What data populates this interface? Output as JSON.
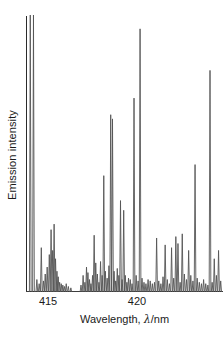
{
  "axes": {
    "ylabel": "Emission intensity",
    "xlabel_prefix": "Wavelength, ",
    "xlabel_symbol": "λ",
    "xlabel_suffix": "/nm",
    "xlabel_full": "Wavelength, λ/nm",
    "xticks": [
      {
        "label": "415",
        "value": 415
      },
      {
        "label": "420",
        "value": 420
      }
    ],
    "line_color": "#2b2b2b"
  },
  "chart_data": {
    "type": "line",
    "subtype": "emission-spectrum-stick",
    "title": "",
    "xlabel": "Wavelength, λ/nm",
    "ylabel": "Emission intensity",
    "xlim": [
      413.76,
      424.83
    ],
    "ylim": [
      0,
      1
    ],
    "xticks": [
      415,
      420
    ],
    "yticks": [],
    "grid": false,
    "legend": null,
    "trace_color": "#555555",
    "note": "Atomic emission line spectrum; y values are relative emission intensity normalized to the tallest lines (=1.0). x values in nm.",
    "series": [
      {
        "name": "Emission intensity",
        "x": [
          414.0,
          414.18,
          414.37,
          414.5,
          414.62,
          414.74,
          414.84,
          414.95,
          415.07,
          415.17,
          415.26,
          415.34,
          415.42,
          415.5,
          415.57,
          415.65,
          415.74,
          415.83,
          415.92,
          416.02,
          416.14,
          416.28,
          416.85,
          416.97,
          417.07,
          417.16,
          417.24,
          417.33,
          417.41,
          417.5,
          417.59,
          417.68,
          417.77,
          417.86,
          417.95,
          418.04,
          418.13,
          418.22,
          418.32,
          418.42,
          418.52,
          418.62,
          418.71,
          418.8,
          418.89,
          418.98,
          419.07,
          419.16,
          419.25,
          419.34,
          419.43,
          419.52,
          419.62,
          419.72,
          419.83,
          419.95,
          420.06,
          420.17,
          420.28,
          420.39,
          420.5,
          420.62,
          420.74,
          420.86,
          420.98,
          421.1,
          421.22,
          421.34,
          421.46,
          421.58,
          421.7,
          421.82,
          421.94,
          422.06,
          422.18,
          422.3,
          422.42,
          422.54,
          422.66,
          422.78,
          422.9,
          423.02,
          423.14,
          423.26,
          423.38,
          423.5,
          423.62,
          423.74,
          423.86,
          423.98,
          424.1,
          424.22,
          424.34,
          424.46,
          424.58,
          424.7
        ],
        "y": [
          1.0,
          1.0,
          0.045,
          0.03,
          0.16,
          0.04,
          0.065,
          0.09,
          0.135,
          0.225,
          0.15,
          0.245,
          0.12,
          0.075,
          0.055,
          0.035,
          0.03,
          0.025,
          0.02,
          0.03,
          0.02,
          0.015,
          0.025,
          0.06,
          0.035,
          0.09,
          0.07,
          0.045,
          0.03,
          0.06,
          0.205,
          0.105,
          0.065,
          0.035,
          0.11,
          0.06,
          0.42,
          0.075,
          0.05,
          0.095,
          0.64,
          0.625,
          0.075,
          0.04,
          0.085,
          0.06,
          0.33,
          0.045,
          0.295,
          0.06,
          0.035,
          0.05,
          0.045,
          0.03,
          0.7,
          0.06,
          0.04,
          0.95,
          0.05,
          0.035,
          0.03,
          0.045,
          0.04,
          0.03,
          0.035,
          0.195,
          0.04,
          0.03,
          0.055,
          0.17,
          0.045,
          0.03,
          0.16,
          0.05,
          0.2,
          0.175,
          0.035,
          0.21,
          0.065,
          0.045,
          0.15,
          0.06,
          0.04,
          0.46,
          0.05,
          0.035,
          0.03,
          0.045,
          0.03,
          0.025,
          0.8,
          0.035,
          0.12,
          0.06,
          0.15,
          0.04
        ]
      }
    ]
  }
}
